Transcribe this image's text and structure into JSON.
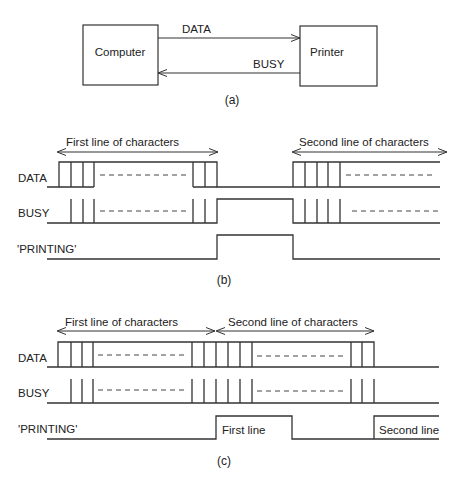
{
  "part_a": {
    "computer_label": "Computer",
    "printer_label": "Printer",
    "data_arrow_label": "DATA",
    "busy_arrow_label": "BUSY",
    "caption": "(a)"
  },
  "part_b": {
    "signal_labels": [
      "DATA",
      "BUSY",
      "'PRINTING'"
    ],
    "span1_label": "First line of characters",
    "span2_label": "Second line of characters",
    "caption": "(b)"
  },
  "part_c": {
    "signal_labels": [
      "DATA",
      "BUSY",
      "'PRINTING'"
    ],
    "span1_label": "First line of characters",
    "span2_label": "Second line of characters",
    "printing_pulse1_label": "First line",
    "printing_pulse2_label": "Second line",
    "caption": "(c)"
  },
  "colors": {
    "line": "#333333",
    "text": "#222222",
    "background": "#ffffff"
  }
}
